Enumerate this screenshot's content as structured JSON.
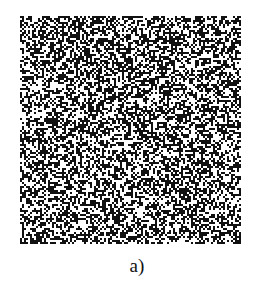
{
  "figure": {
    "caption": "a)",
    "pattern": {
      "description": "random binary cell pattern",
      "cols": 110,
      "rows": 114,
      "fill_ratio": 0.5,
      "colors": {
        "on": "#111111",
        "off": "#ffffff"
      },
      "seed": 1337
    }
  }
}
